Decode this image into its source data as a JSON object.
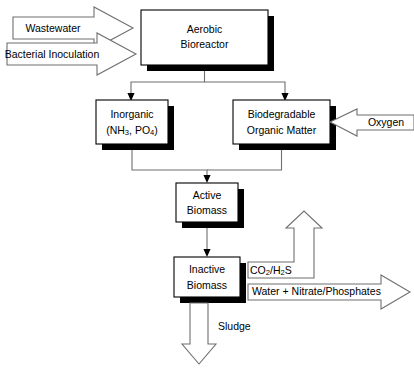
{
  "diagram": {
    "colors": {
      "background": "#ffffff",
      "box_fill": "#ffffff",
      "box_stroke": "#000000",
      "shadow": "#000000",
      "arrow_stroke": "#6f6f6f",
      "text": "#000000"
    },
    "inputs": [
      {
        "id": "wastewater",
        "label": "Wastewater",
        "shape": "right-block-arrow",
        "target": "aerobic-bioreactor"
      },
      {
        "id": "bacterial-inoculation",
        "label": "Bacterial Inoculation",
        "shape": "right-block-arrow",
        "target": "aerobic-bioreactor"
      },
      {
        "id": "oxygen",
        "label": "Oxygen",
        "shape": "left-block-arrow",
        "target": "biodegradable-organic-matter"
      }
    ],
    "nodes": [
      {
        "id": "aerobic-bioreactor",
        "lines": [
          "Aerobic",
          "Bioreactor"
        ],
        "shape": "shadowed-box"
      },
      {
        "id": "inorganic",
        "lines": [
          "Inorganic"
        ],
        "formula_line": {
          "prefix": "(NH",
          "sub1": "3",
          "mid": ", PO",
          "sub2": "4",
          "suffix": ")"
        },
        "shape": "shadowed-box"
      },
      {
        "id": "biodegradable-organic-matter",
        "lines": [
          "Biodegradable",
          "Organic Matter"
        ],
        "shape": "shadowed-box"
      },
      {
        "id": "active-biomass",
        "lines": [
          "Active",
          "Biomass"
        ],
        "shape": "shadowed-box"
      },
      {
        "id": "inactive-biomass",
        "lines": [
          "Inactive",
          "Biomass"
        ],
        "shape": "shadowed-box"
      }
    ],
    "outputs": [
      {
        "id": "co2-h2s",
        "shape": "bent-up-block-arrow",
        "formula": {
          "prefix": "CO",
          "sub1": "2",
          "mid": "/H",
          "sub2": "2",
          "suffix": "S"
        },
        "source": "inactive-biomass"
      },
      {
        "id": "water-nitrate-phosphates",
        "label": "Water + Nitrate/Phosphates",
        "shape": "right-block-arrow",
        "source": "inactive-biomass"
      },
      {
        "id": "sludge",
        "label": "Sludge",
        "shape": "down-block-arrow",
        "source": "inactive-biomass"
      }
    ],
    "flows": [
      {
        "from": "aerobic-bioreactor",
        "to": "inorganic"
      },
      {
        "from": "aerobic-bioreactor",
        "to": "biodegradable-organic-matter"
      },
      {
        "from": "inorganic",
        "to": "active-biomass"
      },
      {
        "from": "biodegradable-organic-matter",
        "to": "active-biomass"
      },
      {
        "from": "active-biomass",
        "to": "inactive-biomass"
      }
    ]
  }
}
